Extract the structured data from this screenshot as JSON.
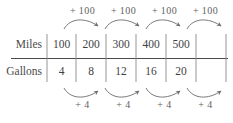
{
  "figure": {
    "type": "ratio-table-with-arrows",
    "table": {
      "rows": [
        {
          "label": "Miles",
          "values": [
            "100",
            "200",
            "300",
            "400",
            "500"
          ]
        },
        {
          "label": "Gallons",
          "values": [
            "4",
            "8",
            "12",
            "16",
            "20"
          ]
        }
      ]
    },
    "top_arrows": {
      "label": "+ 100",
      "labels": [
        "+ 100",
        "+ 100",
        "+ 100",
        "+ 100"
      ],
      "direction": "right",
      "curve": "arc-up"
    },
    "bottom_arrows": {
      "label": "+ 4",
      "labels": [
        "+ 4",
        "+ 4",
        "+ 4",
        "+ 4"
      ],
      "direction": "right",
      "curve": "arc-down"
    },
    "colors": {
      "rule": "#4a4a4a",
      "grid": "#8f8f8f",
      "arrow": "#6b6b6b",
      "text": "#4a4a4a",
      "background": "#ffffff"
    }
  }
}
